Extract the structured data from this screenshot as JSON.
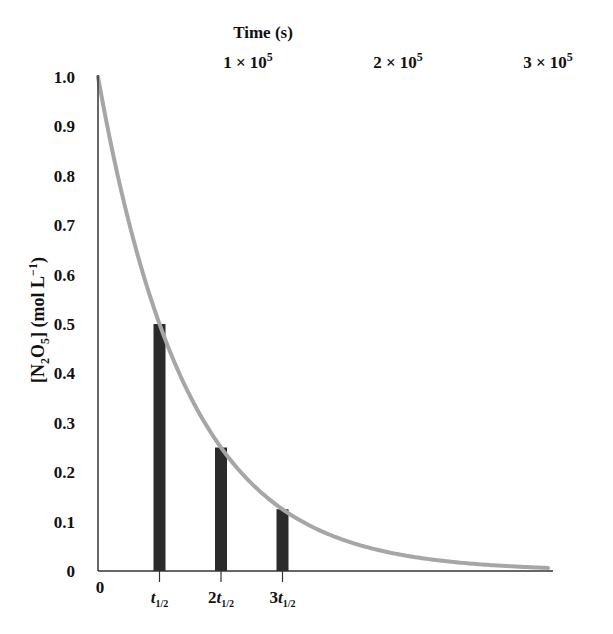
{
  "chart_data": {
    "type": "line",
    "title": "",
    "xlabel": "Time (s)",
    "ylabel": "[N2O5] (mol L−1)",
    "ylabel_parts": {
      "open": "[N",
      "sub1": "2",
      "mid": "O",
      "sub2": "5",
      "close": "] (mol L",
      "sup": "−1",
      "end": ")"
    },
    "ylim": [
      0,
      1.0
    ],
    "xlim": [
      0,
      300000.0
    ],
    "grid": false,
    "y_ticks": [
      {
        "value": 0,
        "label": "0"
      },
      {
        "value": 0.1,
        "label": "0.1"
      },
      {
        "value": 0.2,
        "label": "0.2"
      },
      {
        "value": 0.3,
        "label": "0.3"
      },
      {
        "value": 0.4,
        "label": "0.4"
      },
      {
        "value": 0.5,
        "label": "0.5"
      },
      {
        "value": 0.6,
        "label": "0.6"
      },
      {
        "value": 0.7,
        "label": "0.7"
      },
      {
        "value": 0.8,
        "label": "0.8"
      },
      {
        "value": 0.9,
        "label": "0.9"
      },
      {
        "value": 1.0,
        "label": "1.0"
      }
    ],
    "x_top_ticks": [
      {
        "value": 100000,
        "base": "1 × 10",
        "exp": "5"
      },
      {
        "value": 200000,
        "base": "2 × 10",
        "exp": "5"
      },
      {
        "value": 300000,
        "base": "3 × 10",
        "exp": "5"
      }
    ],
    "x_origin_label": "0",
    "half_life_s": 41000,
    "series": [
      {
        "name": "[N2O5] decay",
        "kind": "exponential",
        "initial": 1.0,
        "t_end_s": 300000,
        "color": "#a6a6a6"
      }
    ],
    "bars": [
      {
        "multiple": 1,
        "label_prefix": "",
        "label_t": "t",
        "label_sub": "1/2",
        "value": 0.5
      },
      {
        "multiple": 2,
        "label_prefix": "2",
        "label_t": "t",
        "label_sub": "1/2",
        "value": 0.25
      },
      {
        "multiple": 3,
        "label_prefix": "3",
        "label_t": "t",
        "label_sub": "1/2",
        "value": 0.125
      }
    ],
    "bar_color": "#2b2b2b",
    "axis_color": "#333333"
  }
}
